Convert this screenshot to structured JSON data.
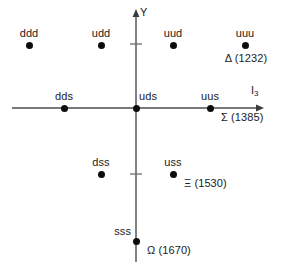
{
  "figure": {
    "name": "baryon-decuplet-weight-diagram",
    "background_color": "#ffffff",
    "marker_color": "#0d0d0d",
    "axis_color": "#4d4d4d"
  },
  "axes": {
    "vertical": {
      "label": "Y",
      "x": 136,
      "top": 11,
      "bottom": 262,
      "arrow": "up",
      "ticks": [
        44,
        174
      ]
    },
    "horizontal": {
      "label": "I",
      "label_sub": "3",
      "y": 108,
      "left": 12,
      "right": 262,
      "arrow": "right"
    }
  },
  "nodes": [
    {
      "id": "ddd",
      "label": "ddd",
      "x": 29,
      "y": 45,
      "label_pos": "above-center",
      "sublabel": ""
    },
    {
      "id": "udd",
      "label": "udd",
      "x": 101,
      "y": 45,
      "label_pos": "above-center",
      "sublabel": ""
    },
    {
      "id": "uud",
      "label": "uud",
      "x": 173,
      "y": 45,
      "label_pos": "above-center",
      "sublabel": ""
    },
    {
      "id": "uuu",
      "label": "uuu",
      "x": 245,
      "y": 45,
      "label_pos": "above-center",
      "sublabel": "Δ (1232)",
      "sublabel_pos": "below-center"
    },
    {
      "id": "dds",
      "label": "dds",
      "x": 64,
      "y": 108,
      "label_pos": "above-center",
      "sublabel": ""
    },
    {
      "id": "uds",
      "label": "uds",
      "x": 136,
      "y": 108,
      "label_pos": "above-right",
      "sublabel": ""
    },
    {
      "id": "uus",
      "label": "uus",
      "x": 210,
      "y": 108,
      "label_pos": "above-center",
      "sublabel": "Σ (1385)",
      "sublabel_pos": "below-right"
    },
    {
      "id": "dss",
      "label": "dss",
      "x": 101,
      "y": 174,
      "label_pos": "above-center",
      "sublabel": ""
    },
    {
      "id": "uss",
      "label": "uss",
      "x": 173,
      "y": 174,
      "label_pos": "above-center",
      "sublabel": "Ξ (1530)",
      "sublabel_pos": "below-right"
    },
    {
      "id": "sss",
      "label": "sss",
      "x": 136,
      "y": 241,
      "label_pos": "above-left",
      "sublabel": "Ω (1670)",
      "sublabel_pos": "below-right"
    }
  ]
}
